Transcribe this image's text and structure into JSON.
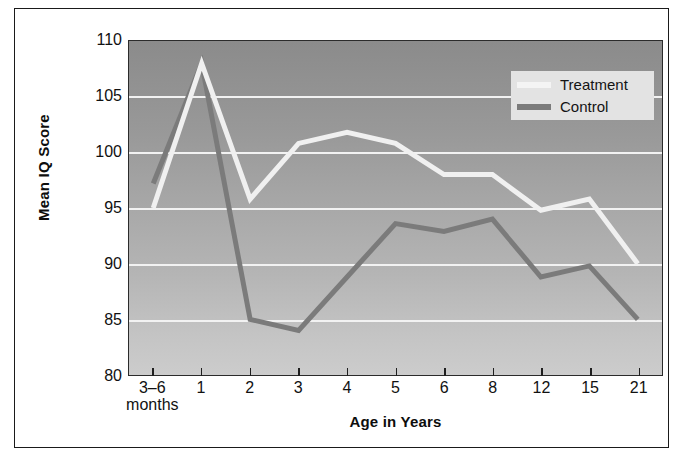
{
  "chart_data": {
    "type": "line",
    "title": "",
    "xlabel": "Age in Years",
    "ylabel": "Mean IQ Score",
    "categories": [
      "3–6 months",
      "1",
      "2",
      "3",
      "4",
      "5",
      "6",
      "8",
      "12",
      "15",
      "21"
    ],
    "category_labels": [
      {
        "main": "3–6",
        "sub": "months"
      },
      {
        "main": "1",
        "sub": ""
      },
      {
        "main": "2",
        "sub": ""
      },
      {
        "main": "3",
        "sub": ""
      },
      {
        "main": "4",
        "sub": ""
      },
      {
        "main": "5",
        "sub": ""
      },
      {
        "main": "6",
        "sub": ""
      },
      {
        "main": "8",
        "sub": ""
      },
      {
        "main": "12",
        "sub": ""
      },
      {
        "main": "15",
        "sub": ""
      },
      {
        "main": "21",
        "sub": ""
      }
    ],
    "ylim": [
      80,
      110
    ],
    "yticks": [
      80,
      85,
      90,
      95,
      100,
      105,
      110
    ],
    "ytick_labels": [
      "80",
      "85",
      "90",
      "95",
      "100",
      "105",
      "110"
    ],
    "grid": true,
    "grid_color": "#f2f2f2",
    "legend_position": "top-right",
    "plot_background": "vertical-gradient-gray",
    "series": [
      {
        "name": "Treatment",
        "color": "#f0f0f0",
        "values": [
          95.0,
          108.0,
          95.8,
          100.8,
          101.8,
          100.8,
          98.0,
          98.0,
          94.8,
          95.8,
          90.0
        ]
      },
      {
        "name": "Control",
        "color": "#7b7b7b",
        "values": [
          97.2,
          108.0,
          85.0,
          84.0,
          88.8,
          93.6,
          92.9,
          94.0,
          88.8,
          89.8,
          85.0
        ]
      }
    ]
  },
  "legend": {
    "items": [
      {
        "label": "Treatment",
        "color": "#f0f0f0"
      },
      {
        "label": "Control",
        "color": "#7b7b7b"
      }
    ]
  },
  "axes": {
    "y_title": "Mean IQ Score",
    "x_title": "Age in Years"
  }
}
